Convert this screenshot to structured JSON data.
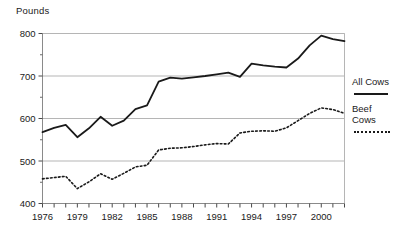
{
  "chart_data": {
    "type": "line",
    "title": "",
    "subtitle": "",
    "xlabel": "",
    "ylabel": "Pounds",
    "ylim": [
      400,
      800
    ],
    "xlim": [
      1976,
      2002
    ],
    "grid": true,
    "grid_axis": "y",
    "legend_position": "right-outside",
    "y_ticks": [
      400,
      500,
      600,
      700,
      800
    ],
    "y_tick_labels": [
      "400",
      "500",
      "600",
      "700",
      "800"
    ],
    "y_minor_ticks": [
      450,
      550,
      650,
      750
    ],
    "x_ticks": [
      1976,
      1977,
      1978,
      1979,
      1980,
      1981,
      1982,
      1983,
      1984,
      1985,
      1986,
      1987,
      1988,
      1989,
      1990,
      1991,
      1992,
      1993,
      1994,
      1995,
      1996,
      1997,
      1998,
      1999,
      2000,
      2001,
      2002
    ],
    "x_tick_labels": [
      "1976",
      "1979",
      "1982",
      "1985",
      "1988",
      "1991",
      "1994",
      "1997",
      "2000"
    ],
    "x_labeled_years": [
      1976,
      1979,
      1982,
      1985,
      1988,
      1991,
      1994,
      1997,
      2000
    ],
    "x": [
      1976,
      1977,
      1978,
      1979,
      1980,
      1981,
      1982,
      1983,
      1984,
      1985,
      1986,
      1987,
      1988,
      1989,
      1990,
      1991,
      1992,
      1993,
      1994,
      1995,
      1996,
      1997,
      1998,
      1999,
      2000,
      2001,
      2002
    ],
    "series": [
      {
        "name": "All Cows",
        "style": "solid",
        "color": "#1a1a1a",
        "values": [
          568,
          578,
          585,
          556,
          577,
          604,
          583,
          595,
          622,
          631,
          687,
          696,
          694,
          697,
          700,
          704,
          708,
          698,
          729,
          725,
          722,
          720,
          741,
          772,
          795,
          787,
          782
        ]
      },
      {
        "name": "Beef Cows",
        "style": "dotted",
        "color": "#1a1a1a",
        "values": [
          458,
          461,
          464,
          435,
          451,
          470,
          457,
          471,
          486,
          490,
          526,
          530,
          531,
          534,
          538,
          541,
          540,
          566,
          570,
          571,
          570,
          578,
          595,
          612,
          625,
          621,
          612
        ]
      }
    ],
    "legend": [
      {
        "label": "All Cows",
        "style": "solid"
      },
      {
        "label": "Beef\nCows",
        "style": "dotted"
      }
    ]
  }
}
